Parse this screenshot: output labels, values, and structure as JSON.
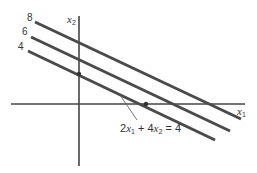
{
  "diagram": {
    "type": "level-lines",
    "axes": {
      "x_label": "x",
      "x_sub": "1",
      "y_label": "x",
      "y_sub": "2"
    },
    "level_lines": [
      {
        "label": "8",
        "value": 8
      },
      {
        "label": "6",
        "value": 6
      },
      {
        "label": "4",
        "value": 4
      }
    ],
    "equation": {
      "coef1": "2",
      "var1": "x",
      "sub1": "1",
      "plus": " + ",
      "coef2": "4",
      "var2": "x",
      "sub2": "2",
      "rhs": " = 4"
    },
    "colors": {
      "line": "#4a4a4a",
      "axis": "#444444",
      "text": "#333333"
    }
  }
}
